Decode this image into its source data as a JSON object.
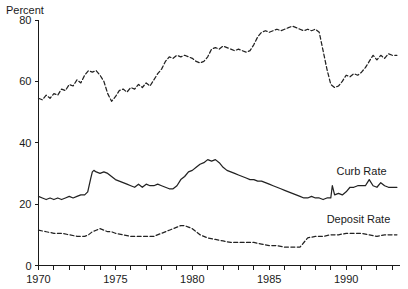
{
  "chart_data": {
    "type": "line",
    "title": "",
    "subtitle": "",
    "xlabel": "",
    "ylabel": "Percent",
    "ylim": [
      0,
      80
    ],
    "xlim": [
      1970,
      1993.5
    ],
    "grid": false,
    "legend_position": "right-inline",
    "y_ticks": [
      "0",
      "20",
      "40",
      "60",
      "80"
    ],
    "y_tick_values": [
      0,
      20,
      40,
      60,
      80
    ],
    "x_ticks": [
      "1970",
      "1975",
      "1980",
      "1985",
      "1990"
    ],
    "x_tick_values": [
      1970,
      1975,
      1980,
      1985,
      1990
    ],
    "x_minor_tick_interval": 1,
    "annotations": [
      {
        "text": "Curb Rate",
        "x": 1991.0,
        "y": 29.5
      },
      {
        "text": "Deposit Rate",
        "x": 1990.8,
        "y": 14.0
      }
    ],
    "series": [
      {
        "name": "Loan Rate",
        "style": "dashed",
        "color": "#222222",
        "label": "",
        "x": [
          1970.0,
          1970.25,
          1970.5,
          1970.75,
          1971.0,
          1971.25,
          1971.5,
          1971.75,
          1972.0,
          1972.25,
          1972.5,
          1972.75,
          1973.0,
          1973.25,
          1973.5,
          1973.75,
          1974.0,
          1974.25,
          1974.5,
          1974.75,
          1975.0,
          1975.25,
          1975.5,
          1975.75,
          1976.0,
          1976.25,
          1976.5,
          1976.75,
          1977.0,
          1977.25,
          1977.5,
          1977.75,
          1978.0,
          1978.25,
          1978.5,
          1978.75,
          1979.0,
          1979.25,
          1979.5,
          1979.75,
          1980.0,
          1980.25,
          1980.5,
          1980.75,
          1981.0,
          1981.25,
          1981.5,
          1981.75,
          1982.0,
          1982.25,
          1982.5,
          1982.75,
          1983.0,
          1983.25,
          1983.5,
          1983.75,
          1984.0,
          1984.25,
          1984.5,
          1984.75,
          1985.0,
          1985.25,
          1985.5,
          1985.75,
          1986.0,
          1986.25,
          1986.5,
          1986.75,
          1987.0,
          1987.25,
          1987.5,
          1987.75,
          1988.0,
          1988.25,
          1988.5,
          1988.75,
          1989.0,
          1989.25,
          1989.5,
          1989.75,
          1990.0,
          1990.25,
          1990.5,
          1990.75,
          1991.0,
          1991.25,
          1991.5,
          1991.75,
          1992.0,
          1992.25,
          1992.5,
          1992.75,
          1993.0,
          1993.3
        ],
        "values": [
          54.5,
          54.0,
          55.5,
          54.5,
          56.0,
          55.5,
          57.5,
          57.0,
          59.0,
          58.5,
          60.5,
          59.5,
          62.0,
          63.5,
          63.0,
          63.5,
          62.0,
          60.0,
          56.0,
          53.5,
          55.0,
          57.0,
          57.5,
          56.5,
          58.0,
          57.5,
          59.0,
          58.0,
          59.5,
          58.5,
          60.5,
          62.5,
          64.0,
          66.5,
          68.0,
          67.5,
          68.5,
          68.0,
          68.5,
          68.0,
          67.5,
          66.5,
          66.0,
          66.5,
          68.0,
          70.5,
          71.0,
          70.5,
          71.5,
          71.0,
          70.5,
          70.0,
          70.5,
          70.0,
          69.5,
          70.0,
          72.0,
          74.5,
          76.0,
          76.5,
          76.0,
          76.5,
          77.0,
          76.5,
          77.0,
          77.5,
          78.0,
          77.5,
          77.0,
          76.5,
          77.0,
          76.5,
          77.0,
          76.0,
          70.0,
          64.0,
          59.0,
          58.0,
          58.5,
          60.0,
          62.0,
          61.5,
          62.5,
          62.0,
          63.0,
          64.5,
          66.5,
          68.5,
          67.0,
          68.5,
          67.5,
          69.0,
          68.5,
          68.5
        ]
      },
      {
        "name": "Curb Rate",
        "style": "solid",
        "color": "#222222",
        "label": "Curb Rate",
        "x": [
          1970.0,
          1970.25,
          1970.5,
          1970.75,
          1971.0,
          1971.25,
          1971.5,
          1971.75,
          1972.0,
          1972.25,
          1972.5,
          1972.75,
          1973.0,
          1973.2,
          1973.4,
          1973.5,
          1973.6,
          1973.75,
          1974.0,
          1974.25,
          1974.5,
          1974.75,
          1975.0,
          1975.25,
          1975.5,
          1975.75,
          1976.0,
          1976.25,
          1976.5,
          1976.75,
          1977.0,
          1977.25,
          1977.5,
          1977.75,
          1978.0,
          1978.25,
          1978.5,
          1978.75,
          1979.0,
          1979.25,
          1979.5,
          1979.75,
          1980.0,
          1980.25,
          1980.5,
          1980.75,
          1981.0,
          1981.25,
          1981.5,
          1981.75,
          1982.0,
          1982.25,
          1982.5,
          1982.75,
          1983.0,
          1983.25,
          1983.5,
          1983.75,
          1984.0,
          1984.25,
          1984.5,
          1984.75,
          1985.0,
          1985.25,
          1985.5,
          1985.75,
          1986.0,
          1986.25,
          1986.5,
          1986.75,
          1987.0,
          1987.25,
          1987.5,
          1987.75,
          1988.0,
          1988.25,
          1988.5,
          1988.75,
          1989.0,
          1989.1,
          1989.25,
          1989.5,
          1989.75,
          1990.0,
          1990.25,
          1990.5,
          1990.75,
          1991.0,
          1991.25,
          1991.5,
          1991.75,
          1992.0,
          1992.25,
          1992.5,
          1992.75,
          1993.0,
          1993.3
        ],
        "values": [
          22.5,
          22.0,
          21.5,
          22.0,
          21.5,
          22.0,
          21.5,
          22.0,
          22.5,
          22.0,
          22.5,
          23.0,
          23.0,
          24.0,
          28.5,
          30.5,
          31.0,
          30.5,
          30.0,
          30.5,
          30.0,
          29.0,
          28.0,
          27.5,
          27.0,
          26.5,
          26.0,
          25.5,
          26.5,
          25.5,
          26.5,
          26.0,
          26.0,
          26.5,
          26.0,
          25.5,
          25.0,
          25.0,
          26.0,
          28.0,
          29.0,
          30.5,
          31.0,
          32.0,
          33.0,
          33.5,
          34.5,
          34.0,
          34.5,
          33.5,
          32.0,
          31.0,
          30.5,
          30.0,
          29.5,
          29.0,
          28.5,
          28.0,
          28.0,
          27.5,
          27.5,
          27.0,
          26.5,
          26.0,
          25.5,
          25.0,
          24.5,
          24.0,
          23.5,
          23.0,
          22.5,
          22.0,
          22.0,
          22.5,
          22.0,
          22.0,
          21.5,
          22.0,
          22.0,
          26.0,
          23.0,
          23.5,
          23.0,
          24.0,
          25.5,
          25.5,
          26.0,
          26.0,
          26.0,
          28.0,
          26.0,
          25.5,
          27.0,
          26.0,
          25.5,
          25.5,
          25.5
        ]
      },
      {
        "name": "Deposit Rate",
        "style": "dashed",
        "color": "#222222",
        "label": "Deposit Rate",
        "x": [
          1970.0,
          1970.5,
          1971.0,
          1971.5,
          1972.0,
          1972.5,
          1973.0,
          1973.25,
          1973.5,
          1973.75,
          1974.0,
          1974.25,
          1974.5,
          1974.75,
          1975.0,
          1975.5,
          1976.0,
          1976.5,
          1977.0,
          1977.5,
          1978.0,
          1978.5,
          1979.0,
          1979.25,
          1979.5,
          1979.75,
          1980.0,
          1980.25,
          1980.5,
          1980.75,
          1981.0,
          1981.5,
          1982.0,
          1982.5,
          1983.0,
          1983.5,
          1984.0,
          1984.5,
          1985.0,
          1985.5,
          1986.0,
          1986.5,
          1987.0,
          1987.25,
          1987.5,
          1988.0,
          1988.5,
          1989.0,
          1989.5,
          1990.0,
          1990.5,
          1991.0,
          1991.5,
          1992.0,
          1992.5,
          1993.0,
          1993.3
        ],
        "values": [
          11.5,
          11.0,
          10.5,
          10.5,
          10.0,
          9.5,
          9.5,
          10.0,
          11.0,
          11.5,
          12.0,
          11.5,
          11.0,
          11.0,
          10.5,
          10.0,
          9.5,
          9.5,
          9.5,
          9.5,
          10.5,
          11.5,
          12.5,
          13.0,
          13.0,
          12.5,
          12.0,
          11.0,
          10.0,
          9.5,
          9.0,
          8.5,
          8.0,
          7.5,
          7.5,
          7.5,
          7.5,
          7.0,
          6.5,
          6.5,
          6.0,
          6.0,
          6.0,
          7.5,
          9.0,
          9.5,
          9.5,
          10.0,
          10.0,
          10.5,
          10.5,
          10.5,
          10.0,
          9.5,
          10.0,
          10.0,
          10.0
        ]
      }
    ]
  },
  "axis": {
    "ylabel": "Percent"
  }
}
